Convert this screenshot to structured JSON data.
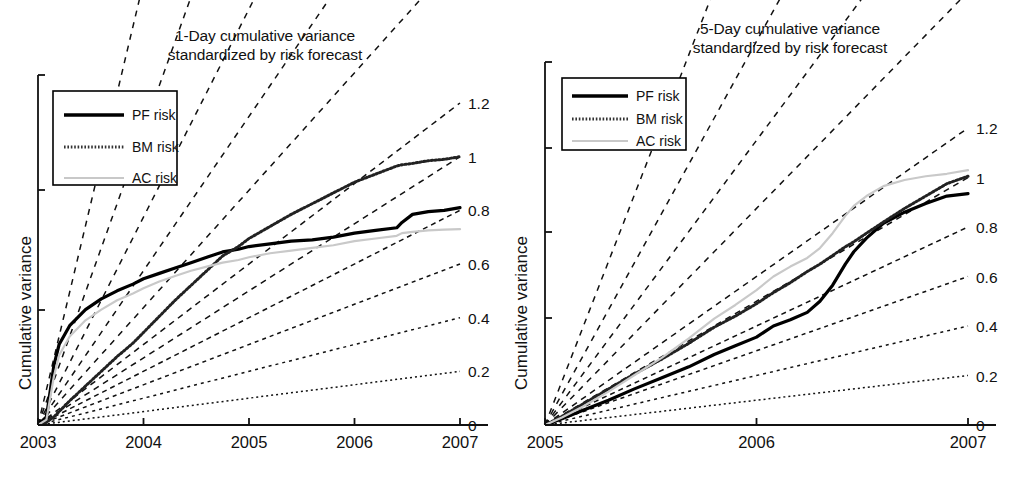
{
  "figure": {
    "ylabel": "Cumulative variance",
    "panels": [
      "left",
      "right"
    ]
  },
  "left": {
    "title_line1": "1-Day cumulative variance",
    "title_line2": "standardized by risk forecast",
    "legend": {
      "items": [
        {
          "label": "PF risk",
          "style": "solid",
          "color": "#000000"
        },
        {
          "label": "BM risk",
          "style": "dotted",
          "color": "#333333"
        },
        {
          "label": "AC risk",
          "style": "solid-light",
          "color": "#c8c8c8"
        }
      ]
    },
    "xticks": [
      "2003",
      "2004",
      "2005",
      "2006",
      "2007"
    ],
    "value_labels": [
      "1.2",
      "1",
      "0.8",
      "0.6",
      "0.4",
      "0.2",
      "0"
    ]
  },
  "right": {
    "title_line1": "5-Day cumulative variance",
    "title_line2": "standardized by risk forecast",
    "legend": {
      "items": [
        {
          "label": "PF risk",
          "style": "solid",
          "color": "#000000"
        },
        {
          "label": "BM risk",
          "style": "dotted",
          "color": "#333333"
        },
        {
          "label": "AC risk",
          "style": "solid-light",
          "color": "#c8c8c8"
        }
      ]
    },
    "xticks": [
      "2005",
      "2006",
      "2007"
    ],
    "value_labels": [
      "1.2",
      "1",
      "0.8",
      "0.6",
      "0.4",
      "0.2",
      "0"
    ]
  },
  "chart_data": [
    {
      "type": "line",
      "panel": "left",
      "title": "1-Day cumulative variance standardized by risk forecast",
      "xlabel": "",
      "ylabel": "Cumulative variance",
      "xlim": [
        2003,
        2007
      ],
      "ylim": [
        0,
        1.3
      ],
      "grid": false,
      "legend_position": "top-left",
      "right_axis_labels": [
        {
          "value": 1.2,
          "text": "1.2"
        },
        {
          "value": 1.0,
          "text": "1"
        },
        {
          "value": 0.8,
          "text": "0.8"
        },
        {
          "value": 0.6,
          "text": "0.6"
        },
        {
          "value": 0.4,
          "text": "0.4"
        },
        {
          "value": 0.2,
          "text": "0.2"
        },
        {
          "value": 0.0,
          "text": "0"
        }
      ],
      "reference_fan": {
        "note": "Dashed straight lines radiating from the origin (2003,0); each terminates at one of the right-edge value labels or runs off the top of the panel.",
        "origin": [
          2003,
          0
        ],
        "end_values_at_2007": [
          0.2,
          0.4,
          0.6,
          0.8,
          1.0,
          1.2
        ],
        "offscreen_slopes_end_y": [
          1.75,
          2.3,
          3.1,
          4.4,
          6.6
        ]
      },
      "x": [
        2003.0,
        2003.08,
        2003.15,
        2003.2,
        2003.3,
        2003.45,
        2003.6,
        2003.75,
        2003.9,
        2004.0,
        2004.15,
        2004.3,
        2004.45,
        2004.6,
        2004.75,
        2004.9,
        2005.0,
        2005.2,
        2005.4,
        2005.6,
        2005.8,
        2006.0,
        2006.2,
        2006.4,
        2006.45,
        2006.55,
        2006.7,
        2006.85,
        2007.0
      ],
      "series": [
        {
          "name": "PF risk",
          "style": "solid",
          "color": "#000000",
          "values": [
            0.0,
            0.03,
            0.22,
            0.3,
            0.37,
            0.43,
            0.47,
            0.5,
            0.525,
            0.545,
            0.565,
            0.585,
            0.605,
            0.625,
            0.645,
            0.655,
            0.665,
            0.675,
            0.685,
            0.69,
            0.7,
            0.715,
            0.725,
            0.735,
            0.755,
            0.785,
            0.795,
            0.8,
            0.81
          ]
        },
        {
          "name": "BM risk",
          "style": "dotted",
          "color": "#222222",
          "values": [
            0.0,
            0.01,
            0.03,
            0.05,
            0.09,
            0.145,
            0.2,
            0.255,
            0.305,
            0.345,
            0.405,
            0.465,
            0.52,
            0.575,
            0.63,
            0.665,
            0.695,
            0.74,
            0.785,
            0.825,
            0.865,
            0.905,
            0.935,
            0.965,
            0.97,
            0.975,
            0.985,
            0.99,
            1.0
          ]
        },
        {
          "name": "AC risk",
          "style": "solid-light",
          "color": "#c9c9c9",
          "values": [
            0.0,
            0.02,
            0.18,
            0.26,
            0.33,
            0.39,
            0.43,
            0.465,
            0.49,
            0.51,
            0.535,
            0.555,
            0.575,
            0.59,
            0.605,
            0.615,
            0.625,
            0.64,
            0.65,
            0.66,
            0.67,
            0.685,
            0.695,
            0.705,
            0.715,
            0.72,
            0.725,
            0.728,
            0.73
          ]
        }
      ]
    },
    {
      "type": "line",
      "panel": "right",
      "title": "5-Day cumulative variance standardized by risk forecast",
      "xlabel": "",
      "ylabel": "Cumulative variance",
      "xlim": [
        2005,
        2007
      ],
      "ylim": [
        0,
        1.3
      ],
      "grid": false,
      "legend_position": "top-left",
      "right_axis_labels": [
        {
          "value": 1.2,
          "text": "1.2"
        },
        {
          "value": 1.0,
          "text": "1"
        },
        {
          "value": 0.8,
          "text": "0.8"
        },
        {
          "value": 0.6,
          "text": "0.6"
        },
        {
          "value": 0.4,
          "text": "0.4"
        },
        {
          "value": 0.2,
          "text": "0.2"
        },
        {
          "value": 0.0,
          "text": "0"
        }
      ],
      "reference_fan": {
        "note": "Dashed straight lines radiating from the origin (2005,0); each terminates at one of the right-edge value labels or runs off the top of the panel.",
        "origin": [
          2005,
          0
        ],
        "end_values_at_2007": [
          0.2,
          0.4,
          0.6,
          0.8,
          1.0,
          1.2
        ],
        "offscreen_slopes_end_y": [
          1.75,
          2.3,
          3.1,
          4.4
        ]
      },
      "x": [
        2005.0,
        2005.08,
        2005.18,
        2005.3,
        2005.42,
        2005.55,
        2005.68,
        2005.8,
        2005.9,
        2006.0,
        2006.08,
        2006.16,
        2006.24,
        2006.3,
        2006.36,
        2006.42,
        2006.46,
        2006.52,
        2006.6,
        2006.7,
        2006.8,
        2006.9,
        2007.0
      ],
      "series": [
        {
          "name": "PF risk",
          "style": "solid",
          "color": "#000000",
          "values": [
            0.0,
            0.025,
            0.06,
            0.1,
            0.145,
            0.19,
            0.235,
            0.285,
            0.32,
            0.355,
            0.4,
            0.425,
            0.455,
            0.5,
            0.565,
            0.65,
            0.7,
            0.755,
            0.815,
            0.86,
            0.895,
            0.925,
            0.935
          ]
        },
        {
          "name": "BM risk",
          "style": "dotted",
          "color": "#222222",
          "values": [
            0.0,
            0.035,
            0.085,
            0.145,
            0.205,
            0.265,
            0.33,
            0.395,
            0.44,
            0.49,
            0.535,
            0.575,
            0.62,
            0.65,
            0.685,
            0.72,
            0.74,
            0.775,
            0.82,
            0.875,
            0.925,
            0.975,
            1.005
          ]
        },
        {
          "name": "AC risk",
          "style": "solid-light",
          "color": "#c9c9c9",
          "values": [
            0.0,
            0.03,
            0.075,
            0.135,
            0.2,
            0.27,
            0.35,
            0.43,
            0.485,
            0.545,
            0.6,
            0.64,
            0.675,
            0.715,
            0.775,
            0.845,
            0.885,
            0.925,
            0.965,
            0.99,
            1.005,
            1.015,
            1.03
          ]
        }
      ]
    }
  ]
}
